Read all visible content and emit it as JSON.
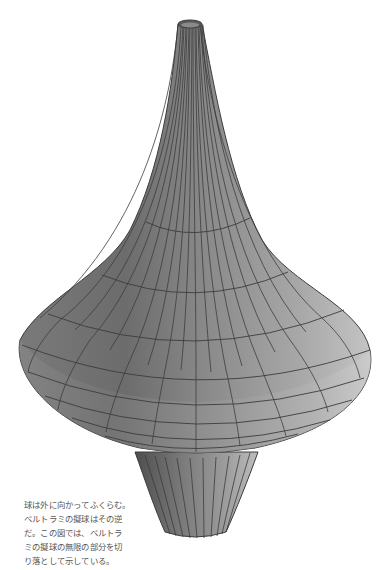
{
  "figure": {
    "colors": {
      "surface_dark": "#6e6e6e",
      "surface_mid": "#9a9a9a",
      "surface_light": "#c8c8c8",
      "grid_line": "#3c3c3c",
      "background": "#ffffff",
      "caption_text": "#555555"
    }
  },
  "caption": {
    "lines": [
      "球は外に向かってふくらむ。",
      "ベルトラミの擬球はその逆",
      "だ。この図では、ベルトラ",
      "ミの擬球の無限の部分を切",
      "り落として示している。"
    ]
  }
}
